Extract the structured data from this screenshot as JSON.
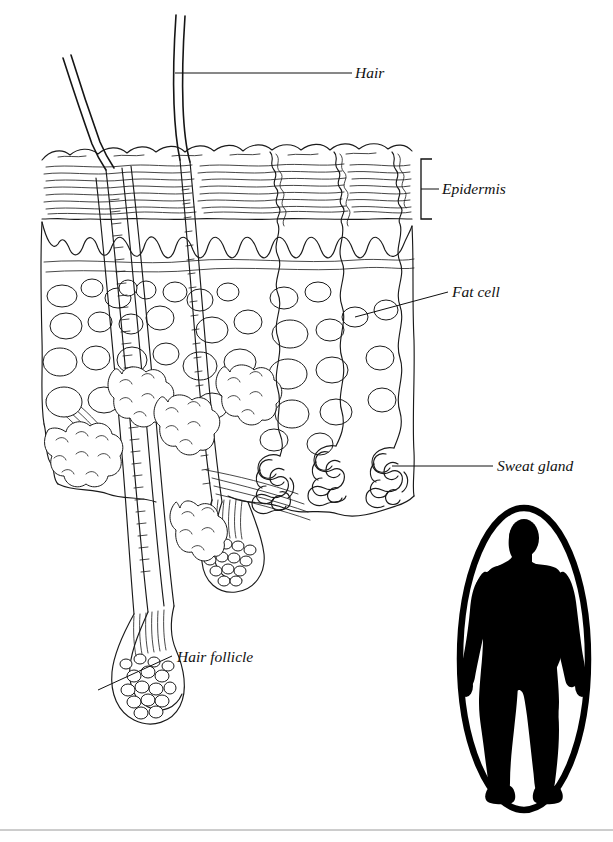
{
  "figure": {
    "style": "black-and-white line drawing",
    "background_color": "#ffffff",
    "ink_color": "#1a1a1a"
  },
  "labels": [
    {
      "id": "hair",
      "text": "Hair",
      "text_x": 355,
      "text_y": 77,
      "leader": "straight-horizontal",
      "leader_from_x": 175,
      "leader_from_y": 73,
      "leader_to_x": 352,
      "leader_to_y": 73
    },
    {
      "id": "epidermis",
      "text": "Epidermis",
      "text_x": 442,
      "text_y": 193,
      "leader": "vertical-bracket",
      "bracket_x": 421,
      "bracket_top": 159,
      "bracket_bottom": 219,
      "bracket_arm": 11,
      "tick_y": 189,
      "tick_to_x": 439
    },
    {
      "id": "fat-cell",
      "text": "Fat cell",
      "text_x": 452,
      "text_y": 297,
      "leader": "diagonal",
      "leader_from_x": 355,
      "leader_from_y": 317,
      "leader_to_x": 448,
      "leader_to_y": 292
    },
    {
      "id": "sweat-gland",
      "text": "Sweat gland",
      "text_x": 497,
      "text_y": 471,
      "leader": "straight-horizontal",
      "leader_from_x": 392,
      "leader_from_y": 466,
      "leader_to_x": 493,
      "leader_to_y": 466
    },
    {
      "id": "hair-follicle",
      "text": "Hair follicle",
      "text_x": 177,
      "text_y": 662,
      "leader": "diagonal",
      "leader_from_x": 98,
      "leader_from_y": 690,
      "leader_to_x": 172,
      "leader_to_y": 656
    }
  ],
  "inset": {
    "id": "body-locator",
    "description": "human body silhouette in oval",
    "shape": "oval",
    "center_x": 524,
    "center_y": 659,
    "radius_x": 66,
    "radius_y": 153,
    "silhouette_color": "#000000",
    "frame_color": "#000000"
  },
  "structures": [
    {
      "id": "hair-shaft",
      "label": "Hair shaft",
      "count": 2
    },
    {
      "id": "epidermis-layer",
      "label": "Epidermis",
      "count": 1
    },
    {
      "id": "dermis-layer",
      "label": "Dermis",
      "count": 1
    },
    {
      "id": "fat-cell",
      "label": "Fat cell",
      "count": 38
    },
    {
      "id": "sebaceous-gland",
      "label": "Sebaceous gland",
      "count": 5
    },
    {
      "id": "sweat-gland",
      "label": "Sweat gland",
      "count": 3
    },
    {
      "id": "sweat-duct",
      "label": "Sweat duct",
      "count": 3
    },
    {
      "id": "hair-follicle",
      "label": "Hair follicle",
      "count": 2
    }
  ],
  "footer_rule": {
    "visible": true,
    "y": 830,
    "color": "#9a9a9a"
  }
}
